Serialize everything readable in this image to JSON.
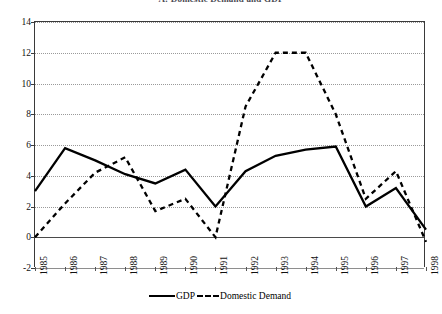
{
  "chart_data": {
    "type": "line",
    "title": "A: Domestic Demand and GDP",
    "xlabel": "",
    "ylabel": "",
    "ylim": [
      -2,
      14
    ],
    "ytick_step": 2,
    "yticks": [
      14,
      12,
      10,
      8,
      6,
      4,
      2,
      0,
      -2
    ],
    "grid": true,
    "legend_position": "bottom",
    "categories": [
      "1985",
      "1986",
      "1987",
      "1988",
      "1989",
      "1990",
      "1991",
      "1992",
      "1993",
      "1994",
      "1995",
      "1996",
      "1997",
      "1998"
    ],
    "series": [
      {
        "name": "GDP",
        "style": "solid",
        "color": "#000000",
        "values": [
          3.0,
          5.8,
          5.0,
          4.1,
          3.5,
          4.4,
          2.0,
          4.3,
          5.3,
          5.7,
          5.9,
          2.0,
          3.2,
          0.5
        ]
      },
      {
        "name": "Domestic Demand",
        "style": "dashed",
        "color": "#000000",
        "values": [
          0.0,
          2.2,
          4.2,
          5.2,
          1.7,
          2.5,
          0.0,
          8.5,
          12.0,
          12.0,
          8.0,
          2.5,
          4.3,
          -0.3
        ]
      }
    ]
  },
  "legend": {
    "gdp_label": "GDP",
    "domestic_demand_label": "Domestic Demand"
  }
}
